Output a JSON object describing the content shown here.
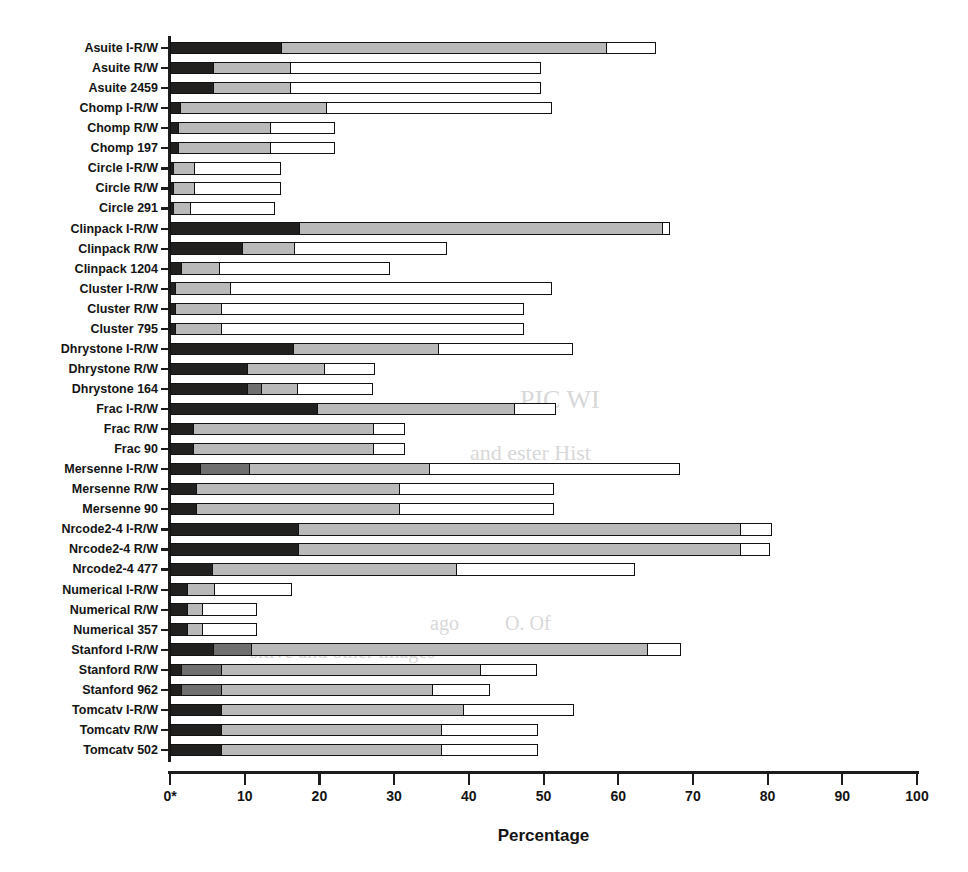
{
  "chart_data": {
    "type": "bar",
    "orientation": "horizontal",
    "stacked": true,
    "title": "",
    "xlabel": "Percentage",
    "ylabel": "",
    "xlim": [
      0,
      100
    ],
    "xticks": [
      0,
      10,
      20,
      30,
      40,
      50,
      60,
      70,
      80,
      90,
      100
    ],
    "xticklabels": [
      "0",
      "10",
      "20",
      "30",
      "40",
      "50",
      "60",
      "70",
      "80",
      "90",
      "100"
    ],
    "zero_tick_annotation": "0*",
    "grid": false,
    "legend": null,
    "series": [
      {
        "name": "segment-1",
        "color": "#221f1f"
      },
      {
        "name": "segment-2",
        "color": "#6f6f6f"
      },
      {
        "name": "segment-3",
        "color": "#b9b9b9"
      },
      {
        "name": "segment-4",
        "color": "#ffffff"
      }
    ],
    "categories": [
      "Asuite I-R/W",
      "Asuite R/W",
      "Asuite 2459",
      "Chomp I-R/W",
      "Chomp R/W",
      "Chomp 197",
      "Circle I-R/W",
      "Circle R/W",
      "Circle 291",
      "Clinpack I-R/W",
      "Clinpack R/W",
      "Clinpack 1204",
      "Cluster I-R/W",
      "Cluster R/W",
      "Cluster 795",
      "Dhrystone I-R/W",
      "Dhrystone R/W",
      "Dhrystone 164",
      "Frac I-R/W",
      "Frac R/W",
      "Frac 90",
      "Mersenne I-R/W",
      "Mersenne R/W",
      "Mersenne 90",
      "Nrcode2-4 I-R/W",
      "Nrcode2-4 R/W",
      "Nrcode2-4 477",
      "Numerical I-R/W",
      "Numerical R/W",
      "Numerical 357",
      "Stanford I-R/W",
      "Stanford R/W",
      "Stanford 962",
      "Tomcatv I-R/W",
      "Tomcatv R/W",
      "Tomcatv 502"
    ],
    "rows": [
      {
        "label": "Asuite I-R/W",
        "segments": [
          15.0,
          0.0,
          43.8,
          6.7
        ],
        "total": 65.5
      },
      {
        "label": "Asuite R/W",
        "segments": [
          6.0,
          0.0,
          10.5,
          33.5
        ],
        "total": 50.0
      },
      {
        "label": "Asuite 2459",
        "segments": [
          6.0,
          0.0,
          10.5,
          33.5
        ],
        "total": 50.0
      },
      {
        "label": "Chomp I-R/W",
        "segments": [
          1.5,
          0.0,
          19.7,
          30.3
        ],
        "total": 51.5
      },
      {
        "label": "Chomp R/W",
        "segments": [
          1.3,
          0.0,
          12.4,
          8.8
        ],
        "total": 22.5
      },
      {
        "label": "Chomp 197",
        "segments": [
          1.3,
          0.0,
          12.4,
          8.8
        ],
        "total": 22.5
      },
      {
        "label": "Circle I-R/W",
        "segments": [
          0.6,
          0.0,
          3.0,
          11.6
        ],
        "total": 15.2
      },
      {
        "label": "Circle R/W",
        "segments": [
          0.6,
          0.0,
          3.0,
          11.6
        ],
        "total": 15.2
      },
      {
        "label": "Circle 291",
        "segments": [
          0.6,
          0.0,
          2.5,
          11.3
        ],
        "total": 14.4
      },
      {
        "label": "Clinpack I-R/W",
        "segments": [
          17.5,
          0.0,
          48.8,
          1.0
        ],
        "total": 67.3
      },
      {
        "label": "Clinpack R/W",
        "segments": [
          9.8,
          0.0,
          7.2,
          20.5
        ],
        "total": 37.5
      },
      {
        "label": "Clinpack 1204",
        "segments": [
          1.6,
          0.0,
          5.4,
          22.8
        ],
        "total": 29.8
      },
      {
        "label": "Cluster I-R/W",
        "segments": [
          0.8,
          0.0,
          7.6,
          43.1
        ],
        "total": 51.5
      },
      {
        "label": "Cluster R/W",
        "segments": [
          0.9,
          0.0,
          6.3,
          40.6
        ],
        "total": 47.8
      },
      {
        "label": "Cluster 795",
        "segments": [
          0.9,
          0.0,
          6.3,
          40.6
        ],
        "total": 47.8
      },
      {
        "label": "Dhrystone I-R/W",
        "segments": [
          16.6,
          0.0,
          19.6,
          18.1
        ],
        "total": 54.3
      },
      {
        "label": "Dhrystone R/W",
        "segments": [
          10.5,
          0.0,
          10.5,
          6.8
        ],
        "total": 27.8
      },
      {
        "label": "Dhrystone 164",
        "segments": [
          10.5,
          2.0,
          5.0,
          10.3
        ],
        "total": 27.8
      },
      {
        "label": "Frac I-R/W",
        "segments": [
          19.8,
          0.0,
          26.6,
          5.6
        ],
        "total": 52.0
      },
      {
        "label": "Frac R/W",
        "segments": [
          3.2,
          0.0,
          24.4,
          4.2
        ],
        "total": 31.8
      },
      {
        "label": "Frac 90",
        "segments": [
          3.2,
          0.0,
          24.4,
          4.2
        ],
        "total": 31.8
      },
      {
        "label": "Mersenne I-R/W",
        "segments": [
          4.2,
          6.8,
          24.3,
          33.5
        ],
        "total": 68.8
      },
      {
        "label": "Mersenne R/W",
        "segments": [
          3.6,
          0.0,
          27.4,
          20.8
        ],
        "total": 51.8
      },
      {
        "label": "Mersenne 90",
        "segments": [
          3.6,
          0.0,
          27.4,
          20.8
        ],
        "total": 51.8
      },
      {
        "label": "Nrcode2-4 I-R/W",
        "segments": [
          17.3,
          0.0,
          59.4,
          4.3
        ],
        "total": 81.0
      },
      {
        "label": "Nrcode2-4 R/W",
        "segments": [
          17.3,
          0.0,
          59.4,
          4.0
        ],
        "total": 80.7
      },
      {
        "label": "Nrcode2-4 477",
        "segments": [
          5.8,
          0.0,
          32.8,
          24.0
        ],
        "total": 62.6
      },
      {
        "label": "Numerical I-R/W",
        "segments": [
          2.5,
          0.0,
          3.8,
          10.4
        ],
        "total": 16.7
      },
      {
        "label": "Numerical R/W",
        "segments": [
          2.5,
          0.0,
          2.2,
          7.3
        ],
        "total": 12.0
      },
      {
        "label": "Numerical 357",
        "segments": [
          2.5,
          0.0,
          2.2,
          7.3
        ],
        "total": 12.0
      },
      {
        "label": "Stanford I-R/W",
        "segments": [
          6.0,
          5.2,
          53.2,
          4.6
        ],
        "total": 69.0
      },
      {
        "label": "Stanford R/W",
        "segments": [
          1.6,
          5.6,
          34.8,
          7.7
        ],
        "total": 49.7
      },
      {
        "label": "Stanford 962",
        "segments": [
          1.6,
          5.6,
          28.5,
          7.7
        ],
        "total": 43.4
      },
      {
        "label": "Tomcatv I-R/W",
        "segments": [
          7.0,
          0.0,
          32.6,
          14.9
        ],
        "total": 54.5
      },
      {
        "label": "Tomcatv R/W",
        "segments": [
          7.0,
          0.0,
          29.6,
          13.0
        ],
        "total": 49.6
      },
      {
        "label": "Tomcatv 502",
        "segments": [
          7.0,
          0.0,
          29.6,
          13.0
        ],
        "total": 49.6
      }
    ]
  },
  "axis": {
    "x_title": "Percentage",
    "zero_label": "0*"
  },
  "ghost_text": [
    {
      "text": "PIC WI",
      "x": 520,
      "y": 385,
      "size": 26
    },
    {
      "text": "and ester Hist",
      "x": 470,
      "y": 440,
      "size": 22
    },
    {
      "text": "ago",
      "x": 430,
      "y": 612,
      "size": 20
    },
    {
      "text": "O.  Of",
      "x": 505,
      "y": 612,
      "size": 20
    },
    {
      "text": "sitive  and other images",
      "x": 250,
      "y": 640,
      "size": 20
    }
  ]
}
